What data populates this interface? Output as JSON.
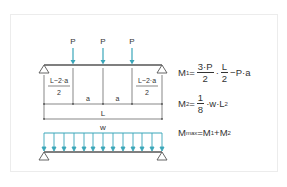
{
  "diagram": {
    "colors": {
      "beam": "#555555",
      "load": "#3aa6b9",
      "text": "#333333",
      "frame": "#ececec"
    },
    "point_loads": {
      "label": "P",
      "count": 3
    },
    "dimensions": {
      "edge_numerator": "L−2·a",
      "edge_denominator": "2",
      "inner": "a",
      "total": "L"
    },
    "distributed_load": {
      "label": "w"
    },
    "formulas": {
      "m1": {
        "lhs": "M",
        "lhs_sub": "1",
        "eq": "=",
        "frac1_num": "3·P",
        "frac1_den": "2",
        "dot": "·",
        "frac2_num": "L",
        "frac2_den": "2",
        "tail": "−P·a"
      },
      "m2": {
        "lhs": "M",
        "lhs_sub": "2",
        "eq": "=",
        "frac_num": "1",
        "frac_den": "8",
        "tail": "·w·L",
        "tail_sup": "2"
      },
      "mmax": {
        "lhs": "M",
        "lhs_sub": "max",
        "rhs": "=M",
        "rhs_sub1": "1",
        "plus": "+M",
        "rhs_sub2": "2"
      }
    }
  }
}
